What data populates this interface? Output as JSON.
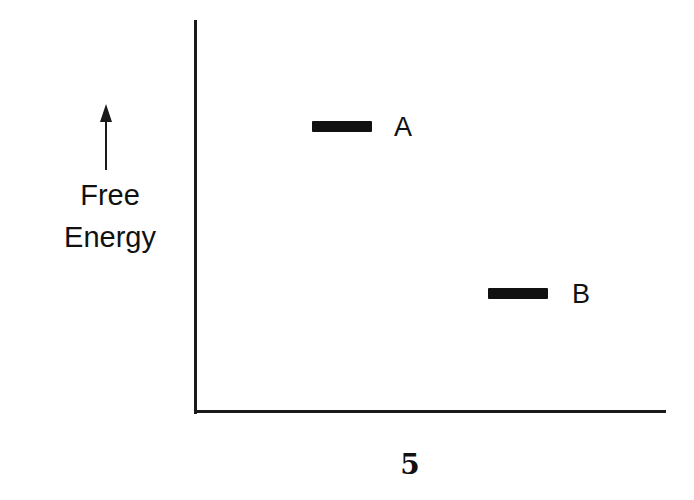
{
  "diagram": {
    "y_axis_label_line1": "Free",
    "y_axis_label_line2": "Energy",
    "levels": [
      {
        "label": "A",
        "relative_energy": "higher"
      },
      {
        "label": "B",
        "relative_energy": "lower"
      }
    ],
    "figure_number": "5",
    "colors": {
      "ink": "#111111",
      "background": "#ffffff"
    }
  }
}
